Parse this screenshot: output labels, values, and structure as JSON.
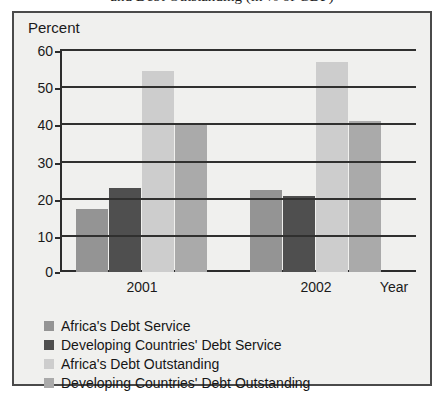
{
  "title": {
    "line_visible": "and Debt Outstanding (in % of GDP)"
  },
  "yaxis": {
    "title": "Percent",
    "ticks": [
      "60",
      "50",
      "40",
      "30",
      "20",
      "10",
      "0"
    ]
  },
  "xaxis": {
    "title": "Year",
    "categories": [
      "2001",
      "2002"
    ]
  },
  "legend": {
    "items": [
      {
        "label": "Africa's Debt Service",
        "color": "#949494"
      },
      {
        "label": "Developing Countries' Debt Service",
        "color": "#4f4f4f"
      },
      {
        "label": "Africa's Debt Outstanding",
        "color": "#cdcdcd"
      },
      {
        "label": "Developing Countries' Debt Outstanding",
        "color": "#aaaaaa"
      }
    ]
  },
  "chart_data": {
    "type": "bar",
    "title": "and Debt Outstanding (in % of GDP)",
    "xlabel": "Year",
    "ylabel": "Percent",
    "ylim": [
      0,
      60
    ],
    "ytick_step": 10,
    "grid": true,
    "legend_position": "bottom-left",
    "categories": [
      "2001",
      "2002"
    ],
    "series": [
      {
        "name": "Africa's Debt Service",
        "color": "#949494",
        "values": [
          17,
          22
        ]
      },
      {
        "name": "Developing Countries' Debt Service",
        "color": "#4f4f4f",
        "values": [
          22.5,
          20.5
        ]
      },
      {
        "name": "Africa's Debt Outstanding",
        "color": "#cdcdcd",
        "values": [
          54,
          56.5
        ]
      },
      {
        "name": "Developing Countries' Debt Outstanding",
        "color": "#aaaaaa",
        "values": [
          40,
          40.5
        ]
      }
    ]
  }
}
